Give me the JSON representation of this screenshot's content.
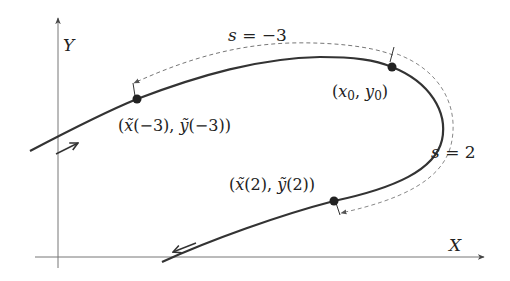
{
  "diagram": {
    "axes": {
      "x_label": "X",
      "y_label": "Y"
    },
    "points": {
      "start_point": {
        "label_parts": [
          "(",
          "x",
          "0",
          ", ",
          "y",
          "0",
          ")"
        ],
        "label": "(x0, y0)"
      },
      "point_minus3": {
        "label": "(x̃(−3), ỹ(−3))",
        "x_part": "(x̃(−3),",
        "y_part": "ỹ(−3))"
      },
      "point_2": {
        "label": "(x̃(2), ỹ(2))",
        "x_part": "(x̃(2),",
        "y_part": "ỹ(2))"
      }
    },
    "arc_labels": {
      "s_minus3": "s = −3",
      "s_2": "s = 2"
    },
    "colors": {
      "curve": "#333333",
      "dashed": "#777777",
      "axis": "#666666"
    }
  }
}
